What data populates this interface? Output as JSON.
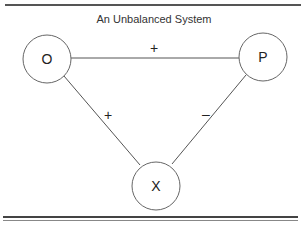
{
  "title": "An Unbalanced System",
  "nodes": [
    {
      "id": "O",
      "label": "O"
    },
    {
      "id": "P",
      "label": "P"
    },
    {
      "id": "X",
      "label": "X"
    }
  ],
  "edges": [
    {
      "from": "O",
      "to": "P",
      "sign": "+"
    },
    {
      "from": "O",
      "to": "X",
      "sign": "+"
    },
    {
      "from": "P",
      "to": "X",
      "sign": "–"
    }
  ],
  "colors": {
    "line": "#555555",
    "text": "#222222",
    "background": "#ffffff"
  }
}
